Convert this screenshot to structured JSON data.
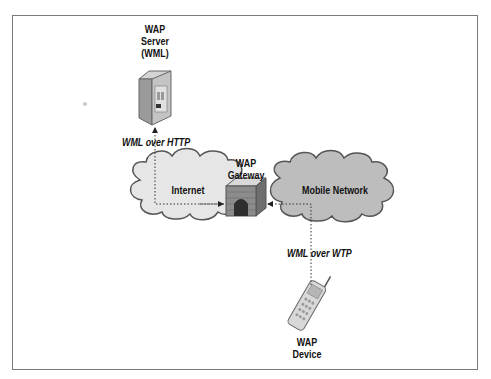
{
  "diagram": {
    "nodes": {
      "server": {
        "label_lines": [
          "WAP",
          "Server",
          "(WML)"
        ],
        "icon": "server-tower-icon"
      },
      "gateway": {
        "label_lines": [
          "WAP",
          "Gateway"
        ],
        "icon": "brick-gateway-icon"
      },
      "device": {
        "label_lines": [
          "WAP",
          "Device"
        ],
        "icon": "mobile-phone-icon"
      },
      "internet": {
        "label": "Internet",
        "icon": "cloud-icon",
        "color": "#e6e6e6"
      },
      "mobile_network": {
        "label": "Mobile Network",
        "icon": "cloud-icon",
        "color": "#bdbdbd"
      }
    },
    "edges": [
      {
        "from": "gateway",
        "to": "server",
        "label": "WML over HTTP",
        "style": "dotted-arrow"
      },
      {
        "from": "device",
        "to": "gateway",
        "label": "WML over WTP",
        "style": "dotted-arrow"
      }
    ],
    "colors": {
      "frame": "#7a7a7a",
      "internet_cloud": "#e6e6e6",
      "mobile_cloud": "#bdbdbd",
      "gateway_brick": "#8c8c8c",
      "outline": "#555555"
    }
  }
}
